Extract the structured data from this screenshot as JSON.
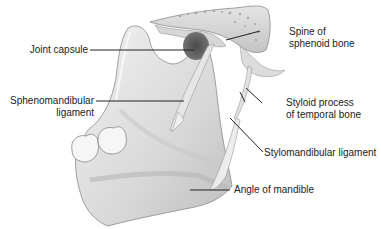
{
  "diagram": {
    "labels": {
      "joint_capsule": "Joint capsule",
      "sphenomandibular_line1": "Sphenomandibular",
      "sphenomandibular_line2": "ligament",
      "spine_line1": "Spine of",
      "spine_line2": "sphenoid bone",
      "styloid_line1": "Styloid process",
      "styloid_line2": "of temporal bone",
      "stylomandibular": "Stylomandibular ligament",
      "angle": "Angle of mandible"
    },
    "colors": {
      "background": "#ffffff",
      "bone_light": "#ececec",
      "bone_mid": "#cfcfcf",
      "bone_shadow": "#9a9a9a",
      "capsule": "#5a5a5a",
      "leader_line": "#222222",
      "text": "#222222"
    }
  }
}
